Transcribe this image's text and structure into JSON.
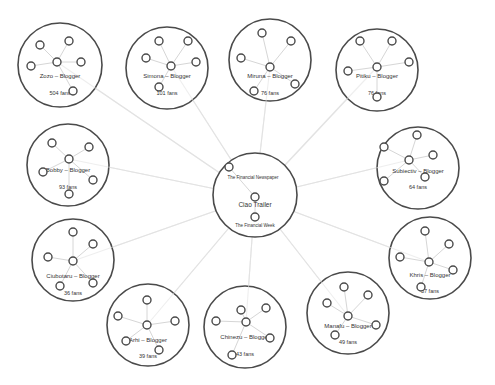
{
  "diagram": {
    "type": "network-cluster-diagram",
    "hub": {
      "cx": 255,
      "cy": 195,
      "r": 42,
      "label": "Ciao Trailer",
      "top_label": "The Financial Newspaper",
      "bottom_label": "The Financial Week",
      "nodes": [
        [
          229,
          167
        ],
        [
          255,
          197
        ],
        [
          255,
          217
        ]
      ]
    },
    "clusters": [
      {
        "id": "zozo",
        "label": "Zozo – Blogger",
        "fans": "504 fans",
        "cx": 60,
        "cy": 65,
        "r": 42,
        "center": [
          57,
          62
        ],
        "nodes": [
          [
            40,
            45
          ],
          [
            69,
            41
          ],
          [
            31,
            66
          ],
          [
            81,
            62
          ],
          [
            73,
            91
          ]
        ],
        "label_y": 78,
        "fans_y": 95
      },
      {
        "id": "simona",
        "label": "Simona – Blogger",
        "fans": "101 fans",
        "cx": 167,
        "cy": 68,
        "r": 41,
        "center": [
          171,
          66
        ],
        "nodes": [
          [
            159,
            41
          ],
          [
            188,
            41
          ],
          [
            146,
            58
          ],
          [
            196,
            62
          ],
          [
            159,
            87
          ]
        ],
        "label_y": 78,
        "fans_y": 95
      },
      {
        "id": "miruna",
        "label": "Miruna – Blogger",
        "fans": "76 fans",
        "cx": 270,
        "cy": 60,
        "r": 41,
        "center": [
          270,
          67
        ],
        "nodes": [
          [
            262,
            33
          ],
          [
            291,
            41
          ],
          [
            241,
            58
          ],
          [
            295,
            84
          ],
          [
            254,
            91
          ]
        ],
        "label_y": 78,
        "fans_y": 95
      },
      {
        "id": "pitiku",
        "label": "Pitiku – Blogger",
        "fans": "76 fans",
        "cx": 377,
        "cy": 70,
        "r": 41,
        "center": [
          377,
          67
        ],
        "nodes": [
          [
            360,
            41
          ],
          [
            392,
            41
          ],
          [
            348,
            71
          ],
          [
            409,
            62
          ],
          [
            377,
            97
          ]
        ],
        "label_y": 78,
        "fans_y": 95
      },
      {
        "id": "bobby",
        "label": "Bobby – Blogger",
        "fans": "93 fans",
        "cx": 68,
        "cy": 165,
        "r": 41,
        "center": [
          69,
          159
        ],
        "nodes": [
          [
            52,
            143
          ],
          [
            89,
            147
          ],
          [
            43,
            172
          ],
          [
            93,
            180
          ],
          [
            69,
            194
          ]
        ],
        "label_y": 172,
        "fans_y": 189
      },
      {
        "id": "subiectiv",
        "label": "Subiectiv – Blogger",
        "fans": "64 fans",
        "cx": 418,
        "cy": 168,
        "r": 41,
        "center": [
          409,
          160
        ],
        "nodes": [
          [
            417,
            135
          ],
          [
            384,
            147
          ],
          [
            433,
            155
          ],
          [
            384,
            181
          ],
          [
            425,
            177
          ]
        ],
        "label_y": 173,
        "fans_y": 189
      },
      {
        "id": "ciubotaru",
        "label": "Ciubotaru – Blogger",
        "fans": "36 fans",
        "cx": 73,
        "cy": 260,
        "r": 41,
        "center": [
          73,
          261
        ],
        "nodes": [
          [
            73,
            232
          ],
          [
            93,
            244
          ],
          [
            48,
            257
          ],
          [
            60,
            286
          ],
          [
            93,
            283
          ]
        ],
        "label_y": 278,
        "fans_y": 295
      },
      {
        "id": "khris",
        "label": "Khris – Blogger",
        "fans": "57 fans",
        "cx": 430,
        "cy": 258,
        "r": 41,
        "center": [
          429,
          262
        ],
        "nodes": [
          [
            425,
            231
          ],
          [
            449,
            244
          ],
          [
            400,
            257
          ],
          [
            453,
            270
          ],
          [
            421,
            287
          ]
        ],
        "label_y": 277,
        "fans_y": 293
      },
      {
        "id": "arhi",
        "label": "Arhi – Blogger",
        "fans": "39 fans",
        "cx": 148,
        "cy": 325,
        "r": 41,
        "center": [
          147,
          325
        ],
        "nodes": [
          [
            147,
            300
          ],
          [
            118,
            316
          ],
          [
            175,
            321
          ],
          [
            126,
            341
          ],
          [
            159,
            350
          ]
        ],
        "label_y": 342,
        "fans_y": 358
      },
      {
        "id": "chinezu",
        "label": "Chinezu – Blogger",
        "fans": "43 fans",
        "cx": 245,
        "cy": 327,
        "r": 41,
        "center": [
          246,
          322
        ],
        "nodes": [
          [
            241,
            310
          ],
          [
            266,
            308
          ],
          [
            216,
            321
          ],
          [
            270,
            338
          ],
          [
            232,
            355
          ]
        ],
        "label_y": 339,
        "fans_y": 356
      },
      {
        "id": "manafu",
        "label": "Manafu – Blogger",
        "fans": "49 fans",
        "cx": 348,
        "cy": 313,
        "r": 41,
        "center": [
          348,
          316
        ],
        "nodes": [
          [
            344,
            287
          ],
          [
            368,
            295
          ],
          [
            327,
            303
          ],
          [
            376,
            325
          ],
          [
            335,
            335
          ]
        ],
        "label_y": 328,
        "fans_y": 344
      }
    ],
    "colors": {
      "circle_stroke": "#4a4a4a",
      "link": "#e2e2e2",
      "text": "#333333",
      "background": "#ffffff"
    }
  }
}
